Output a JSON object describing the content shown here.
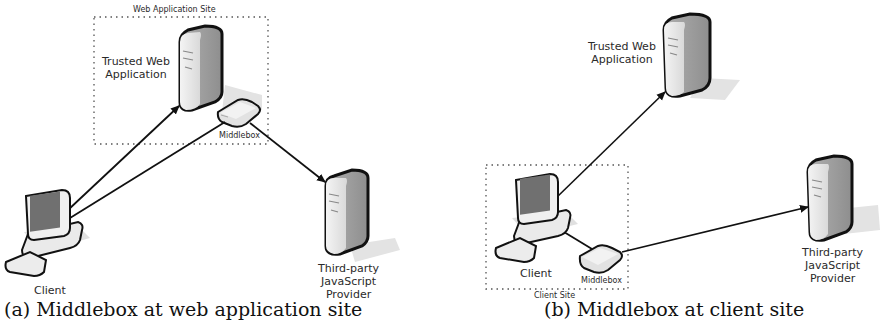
{
  "figure": {
    "panel_a": {
      "site_label": "Web Application Site",
      "trusted_app_label_line1": "Trusted Web",
      "trusted_app_label_line2": "Application",
      "middlebox_label": "Middlebox",
      "client_label": "Client",
      "provider_label_line1": "Third-party",
      "provider_label_line2": "JavaScript",
      "provider_label_line3": "Provider",
      "caption": "(a) Middlebox at web application site"
    },
    "panel_b": {
      "trusted_app_label_line1": "Trusted Web",
      "trusted_app_label_line2": "Application",
      "client_label": "Client",
      "middlebox_label": "Middlebox",
      "site_label": "Client Site",
      "provider_label_line1": "Third-party",
      "provider_label_line2": "JavaScript",
      "provider_label_line3": "Provider",
      "caption": "(b) Middlebox at client site"
    }
  }
}
